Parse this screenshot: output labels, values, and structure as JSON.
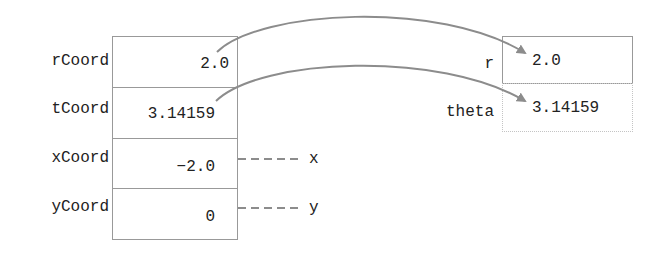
{
  "left_object": {
    "fields": [
      {
        "name": "rCoord",
        "value": "2.0"
      },
      {
        "name": "tCoord",
        "value": "3.14159"
      },
      {
        "name": "xCoord",
        "value": "−2.0"
      },
      {
        "name": "yCoord",
        "value": "0"
      }
    ]
  },
  "right_object": {
    "fields": [
      {
        "name": "r",
        "value": "2.0"
      },
      {
        "name": "theta",
        "value": "3.14159"
      }
    ]
  },
  "aliases": [
    {
      "from": "xCoord",
      "label": "x"
    },
    {
      "from": "yCoord",
      "label": "y"
    }
  ],
  "arrows": [
    {
      "from": "rCoord",
      "to": "r"
    },
    {
      "from": "tCoord",
      "to": "theta"
    }
  ],
  "colors": {
    "line": "#8c8c8c",
    "border": "#999999",
    "text": "#222222"
  }
}
